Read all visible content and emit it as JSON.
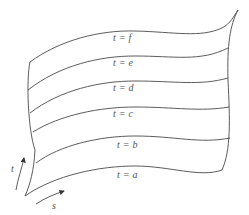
{
  "diagram": {
    "type": "parametric surface with level curves",
    "curve_labels": [
      {
        "var": "t",
        "value": "f"
      },
      {
        "var": "t",
        "value": "e"
      },
      {
        "var": "t",
        "value": "d"
      },
      {
        "var": "t",
        "value": "c"
      },
      {
        "var": "t",
        "value": "b"
      },
      {
        "var": "t",
        "value": "a"
      }
    ],
    "axes": {
      "t_label": "t",
      "s_label": "s"
    },
    "equals": "="
  }
}
